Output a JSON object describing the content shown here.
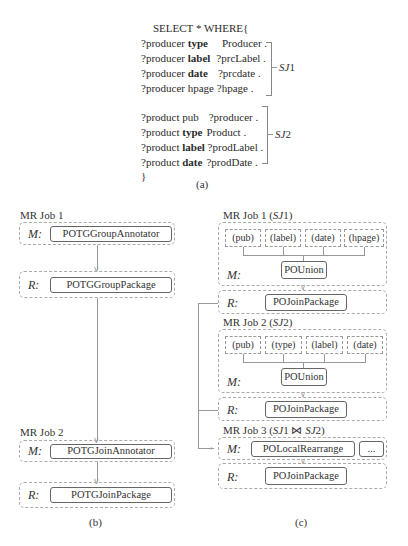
{
  "panel_a": {
    "select": "SELECT * WHERE{",
    "group1": [
      {
        "subj": "?producer",
        "pred": "type",
        "obj": "Producer ."
      },
      {
        "subj": "?producer",
        "pred": "label",
        "obj": "?prcLabel ."
      },
      {
        "subj": "?producer",
        "pred": "date",
        "obj": "?prcdate ."
      },
      {
        "subj": "?producer",
        "pred": "hpage",
        "obj": "?hpage ."
      }
    ],
    "group1_label": "SJ1",
    "group2": [
      {
        "subj": "?product",
        "pred": "pub",
        "obj": "?producer ."
      },
      {
        "subj": "?product",
        "pred": "type",
        "obj": "Product ."
      },
      {
        "subj": "?product",
        "pred": "label",
        "obj": "?prodLabel ."
      },
      {
        "subj": "?product",
        "pred": "date",
        "obj": "?prodDate ."
      }
    ],
    "group2_label": "SJ2",
    "close": "}",
    "caption": "(a)"
  },
  "panel_b": {
    "job1": {
      "title": "MR Job 1",
      "map_label": "M:",
      "map_op": "POTGGroupAnnotator",
      "reduce_label": "R:",
      "reduce_op": "POTGGroupPackage"
    },
    "job2": {
      "title": "MR Job 2",
      "map_label": "M:",
      "map_op": "POTGJoinAnnotator",
      "reduce_label": "R:",
      "reduce_op": "POTGJoinPackage"
    },
    "caption": "(b)"
  },
  "panel_c": {
    "job1": {
      "title": "MR Job 1 (SJ1)",
      "subs": [
        "(pub)",
        "(label)",
        "(date)",
        "(hpage)"
      ],
      "map_label": "M:",
      "map_op": "POUnion",
      "reduce_label": "R:",
      "reduce_op": "POJoinPackage"
    },
    "job2": {
      "title": "MR Job 2 (SJ2)",
      "subs": [
        "(pub)",
        "(type)",
        "(label)",
        "(date)"
      ],
      "map_label": "M:",
      "map_op": "POUnion",
      "reduce_label": "R:",
      "reduce_op": "POJoinPackage"
    },
    "job3": {
      "title": "MR Job 3 (SJ1 ⋈ SJ2)",
      "map_label": "M:",
      "map_op": "POLocalRearrange",
      "map_extra": "...",
      "reduce_label": "R:",
      "reduce_op": "POJoinPackage"
    },
    "caption": "(c)"
  }
}
